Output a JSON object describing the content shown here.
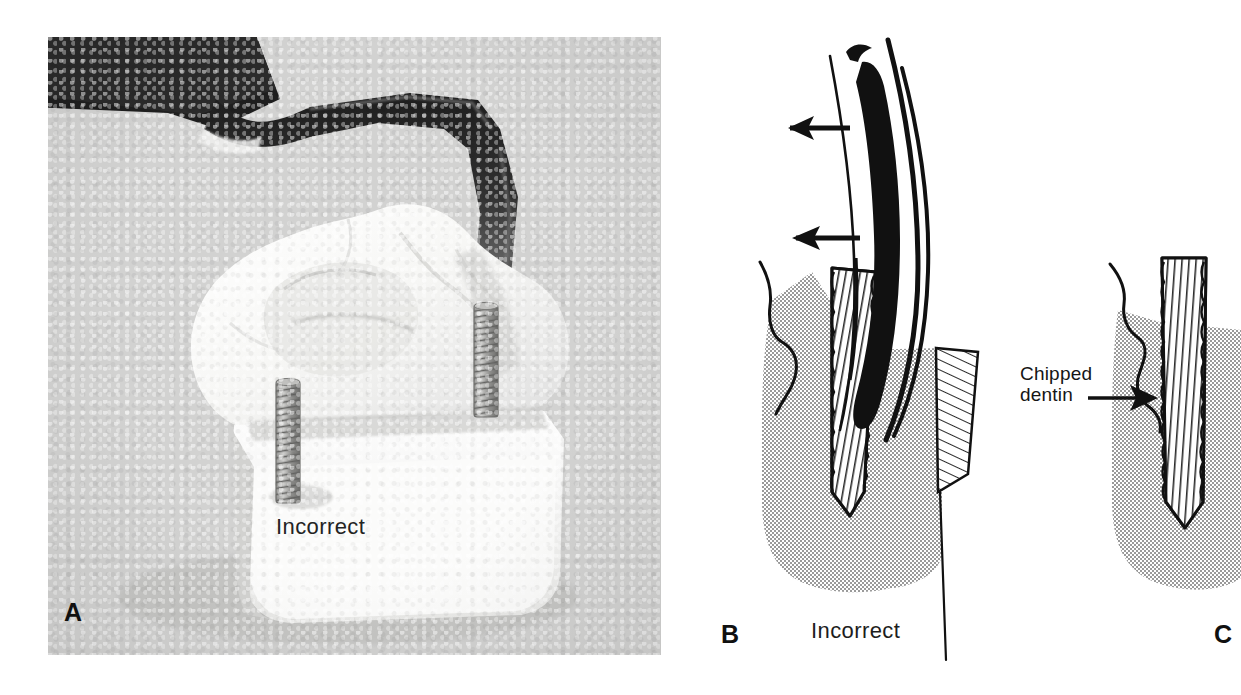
{
  "figure": {
    "type": "dental-illustration-figure",
    "background_color": "#ffffff",
    "panels": [
      "A",
      "B",
      "C"
    ]
  },
  "panel_a": {
    "label": "A",
    "caption": "Incorrect",
    "media": "photograph",
    "description_icons": {
      "instrument": "dental-handpiece-icon",
      "pin": "threaded-pin-icon"
    },
    "photo_background_color": "#d3d3d1"
  },
  "panel_b": {
    "label": "B",
    "caption": "Incorrect",
    "arrows": [
      {
        "name": "upper-arrow",
        "direction": "left"
      },
      {
        "name": "lower-arrow",
        "direction": "left"
      }
    ],
    "shading_color": "#bdbdbd",
    "line_color": "#111111"
  },
  "panel_c": {
    "label": "C",
    "annotation": "Chipped\ndentin",
    "annotation_line1": "Chipped",
    "annotation_line2": "dentin",
    "arrow": {
      "name": "chipped-dentin-arrow",
      "direction": "right"
    },
    "shading_color": "#bdbdbd",
    "line_color": "#111111"
  }
}
